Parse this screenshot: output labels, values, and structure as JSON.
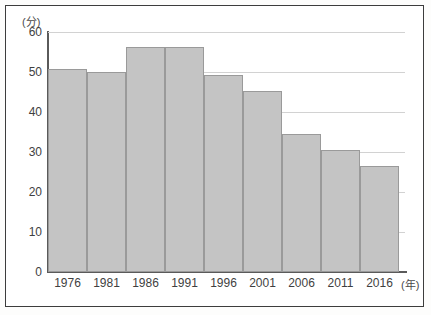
{
  "chart_data": {
    "type": "bar",
    "title": "",
    "xlabel": "年",
    "ylabel": "分",
    "y_unit_label": "(分)",
    "x_unit_label": "(年)",
    "categories": [
      "1976",
      "1981",
      "1986",
      "1991",
      "1996",
      "2001",
      "2006",
      "2011",
      "2016"
    ],
    "values": [
      50.8,
      50.0,
      56.2,
      56.2,
      49.2,
      45.3,
      34.5,
      30.5,
      26.5
    ],
    "ylim": [
      0,
      60
    ],
    "yticks": [
      0,
      10,
      20,
      30,
      40,
      50,
      60
    ],
    "ytick_labels": [
      "0",
      "10",
      "20",
      "30",
      "40",
      "50",
      "60"
    ],
    "grid": true,
    "grid_axis": "y",
    "legend": "none",
    "bar_color": "#c4c4c4",
    "bar_edge_color": "#9a9a9a",
    "gridline_color": "#d2d2d2",
    "axis_color": "#5a5a5a",
    "background_color": "#ffffff",
    "border_color": "#3d3d3d"
  }
}
